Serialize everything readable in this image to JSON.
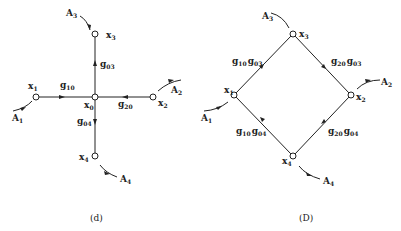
{
  "diagram_d": {
    "caption": "(d)",
    "nodes": [
      {
        "id": "x0",
        "label": "x",
        "sub": "0"
      },
      {
        "id": "x1",
        "label": "x",
        "sub": "1"
      },
      {
        "id": "x2",
        "label": "x",
        "sub": "2"
      },
      {
        "id": "x3",
        "label": "x",
        "sub": "3"
      },
      {
        "id": "x4",
        "label": "x",
        "sub": "4"
      }
    ],
    "edges": [
      {
        "from": "x1",
        "to": "x0",
        "label": "g",
        "sub": "10"
      },
      {
        "from": "x2",
        "to": "x0",
        "label": "g",
        "sub": "20"
      },
      {
        "from": "x0",
        "to": "x3",
        "label": "g",
        "sub": "03"
      },
      {
        "from": "x0",
        "to": "x4",
        "label": "g",
        "sub": "04"
      }
    ],
    "inputs": [
      {
        "node": "x1",
        "label": "A",
        "sub": "1"
      },
      {
        "node": "x2",
        "label": "A",
        "sub": "2"
      },
      {
        "node": "x3",
        "label": "A",
        "sub": "3"
      },
      {
        "node": "x4",
        "label": "A",
        "sub": "4"
      }
    ]
  },
  "diagram_D": {
    "caption": "(D)",
    "nodes": [
      {
        "id": "x1",
        "label": "x",
        "sub": "1"
      },
      {
        "id": "x2",
        "label": "x",
        "sub": "2"
      },
      {
        "id": "x3",
        "label": "x",
        "sub": "3"
      },
      {
        "id": "x4",
        "label": "x",
        "sub": "4"
      }
    ],
    "edges": [
      {
        "from": "x1",
        "to": "x3",
        "label1": "g",
        "sub1": "10",
        "label2": "g",
        "sub2": "03"
      },
      {
        "from": "x3",
        "to": "x2",
        "label1": "g",
        "sub1": "20",
        "label2": "g",
        "sub2": "03"
      },
      {
        "from": "x4",
        "to": "x1",
        "label1": "g",
        "sub1": "10",
        "label2": "g",
        "sub2": "04"
      },
      {
        "from": "x4",
        "to": "x2",
        "label1": "g",
        "sub1": "20",
        "label2": "g",
        "sub2": "04"
      }
    ],
    "inputs": [
      {
        "node": "x1",
        "label": "A",
        "sub": "1"
      },
      {
        "node": "x2",
        "label": "A",
        "sub": "2"
      },
      {
        "node": "x3",
        "label": "A",
        "sub": "3"
      },
      {
        "node": "x4",
        "label": "A",
        "sub": "4"
      }
    ]
  }
}
